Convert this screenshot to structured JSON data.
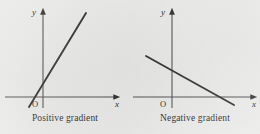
{
  "figure": {
    "background_color": "#f1f1f0",
    "ink_color": "#2b2b2b",
    "panels": [
      {
        "id": "positive",
        "caption": "Positive gradient",
        "y_axis_label": "y",
        "x_axis_label": "x",
        "origin_label": "O",
        "gradient_sign": "positive",
        "axes": {
          "x_axis": {
            "x1": 5,
            "y1": 97,
            "x2": 114,
            "y2": 97
          },
          "y_axis": {
            "x1": 43,
            "y1": 108,
            "x2": 43,
            "y2": 14
          }
        },
        "line": {
          "x1": 29,
          "y1": 107,
          "x2": 86,
          "y2": 13
        },
        "label_positions": {
          "y": {
            "x": 34,
            "y": 15
          },
          "x": {
            "x": 117,
            "y": 107
          },
          "origin": {
            "x": 35,
            "y": 107
          }
        }
      },
      {
        "id": "negative",
        "caption": "Negative gradient",
        "y_axis_label": "y",
        "x_axis_label": "x",
        "origin_label": "O",
        "gradient_sign": "negative",
        "axes": {
          "x_axis": {
            "x1": 3,
            "y1": 97,
            "x2": 121,
            "y2": 97
          },
          "y_axis": {
            "x1": 42,
            "y1": 108,
            "x2": 42,
            "y2": 14
          }
        },
        "line": {
          "x1": 16,
          "y1": 56,
          "x2": 104,
          "y2": 105
        },
        "label_positions": {
          "y": {
            "x": 33,
            "y": 15
          },
          "x": {
            "x": 124,
            "y": 107
          },
          "origin": {
            "x": 33,
            "y": 107
          }
        }
      }
    ]
  }
}
